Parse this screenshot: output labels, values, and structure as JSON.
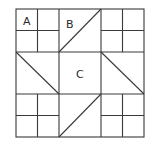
{
  "figure": {
    "type": "quilt-block-diagram",
    "grid": {
      "blocks_per_side": 3,
      "corner_block_subdivision": 2
    },
    "labels": {
      "a": "A",
      "b": "B",
      "c": "C"
    },
    "blocks": [
      {
        "row": 0,
        "col": 0,
        "kind": "four-patch",
        "label_key": "a"
      },
      {
        "row": 0,
        "col": 1,
        "kind": "half-square-triangle",
        "diagonal": "bottom-left-to-top-right",
        "label_key": "b"
      },
      {
        "row": 0,
        "col": 2,
        "kind": "four-patch"
      },
      {
        "row": 1,
        "col": 0,
        "kind": "half-square-triangle",
        "diagonal": "top-left-to-bottom-right"
      },
      {
        "row": 1,
        "col": 1,
        "kind": "plain-square",
        "label_key": "c"
      },
      {
        "row": 1,
        "col": 2,
        "kind": "half-square-triangle",
        "diagonal": "top-left-to-bottom-right"
      },
      {
        "row": 2,
        "col": 0,
        "kind": "four-patch"
      },
      {
        "row": 2,
        "col": 1,
        "kind": "half-square-triangle",
        "diagonal": "bottom-left-to-top-right"
      },
      {
        "row": 2,
        "col": 2,
        "kind": "four-patch"
      }
    ],
    "colors": {
      "line": "#3a3a3a",
      "background": "#ffffff",
      "text": "#2a2a2a"
    }
  }
}
